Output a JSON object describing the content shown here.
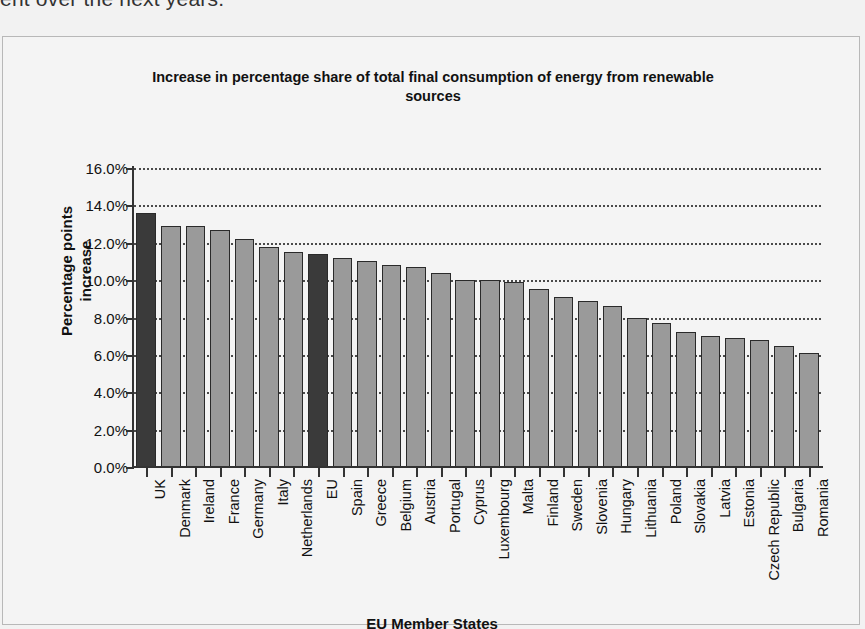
{
  "document": {
    "partial_text": "ent over the next years."
  },
  "chart": {
    "title": "Increase in percentage share of total final consumption of energy from renewable sources",
    "ylabel_line1": "Percentage points",
    "ylabel_line2": "increase",
    "xlabel": "EU Member States",
    "highlight_color": "#3a3a3a",
    "bar_color": "#9a9a9a",
    "background_color": "#f4f4f4"
  },
  "chart_data": {
    "type": "bar",
    "title": "Increase in percentage share of total final consumption of energy from renewable sources",
    "xlabel": "EU Member States",
    "ylabel": "Percentage points increase",
    "ylim": [
      0,
      16
    ],
    "ytick_labels": [
      "0.0%",
      "2.0%",
      "4.0%",
      "6.0%",
      "8.0%",
      "10.0%",
      "12.0%",
      "14.0%",
      "16.0%"
    ],
    "ytick_values": [
      0,
      2,
      4,
      6,
      8,
      10,
      12,
      14,
      16
    ],
    "grid": "horizontal-dotted",
    "legend": "none",
    "categories": [
      "UK",
      "Denmark",
      "Ireland",
      "France",
      "Germany",
      "Italy",
      "Netherlands",
      "EU",
      "Spain",
      "Greece",
      "Belgium",
      "Austria",
      "Portugal",
      "Cyprus",
      "Luxembourg",
      "Malta",
      "Finland",
      "Sweden",
      "Slovenia",
      "Hungary",
      "Lithuania",
      "Poland",
      "Slovakia",
      "Latvia",
      "Estonia",
      "Czech Republic",
      "Bulgaria",
      "Romania"
    ],
    "values": [
      13.6,
      12.9,
      12.9,
      12.7,
      12.2,
      11.8,
      11.5,
      11.4,
      11.2,
      11.0,
      10.8,
      10.7,
      10.4,
      10.0,
      10.0,
      9.9,
      9.5,
      9.1,
      8.9,
      8.6,
      8.0,
      7.7,
      7.2,
      7.0,
      6.9,
      6.8,
      6.5,
      6.1
    ],
    "highlighted": [
      "UK",
      "EU"
    ]
  }
}
